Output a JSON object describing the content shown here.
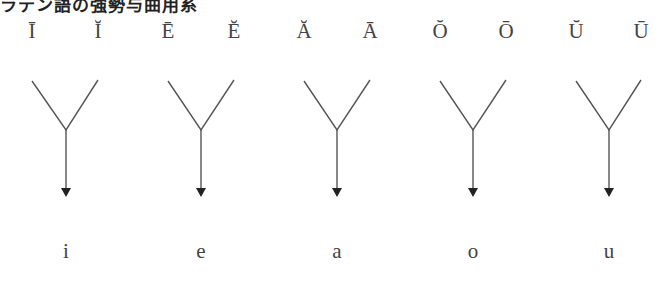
{
  "title": "ラテン語の強勢与曲用系",
  "groups": [
    {
      "long": "Ī",
      "short": "Ĭ",
      "result": "i"
    },
    {
      "long": "Ē",
      "short": "Ĕ",
      "result": "e"
    },
    {
      "long": "Ă",
      "short": "Ā",
      "result": "a"
    },
    {
      "long": "Ŏ",
      "short": "Ō",
      "result": "o"
    },
    {
      "long": "Ŭ",
      "short": "Ū",
      "result": "u"
    }
  ],
  "colors": {
    "line": "#555555",
    "arrowhead": "#222222",
    "text": "#444444"
  }
}
